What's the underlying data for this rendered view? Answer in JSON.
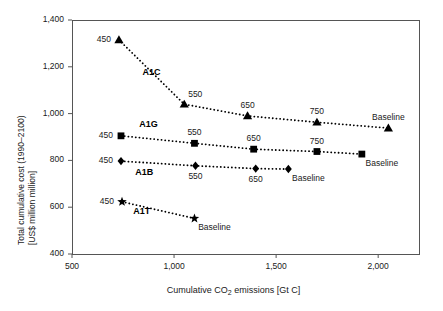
{
  "chart_data": {
    "type": "scatter",
    "title": "",
    "xlabel": "Cumulative CO2 emissions [Gt C]",
    "xlabel_parts": {
      "pre": "Cumulative CO",
      "sub": "2",
      "post": " emissions [Gt C]"
    },
    "ylabel_line1": "Total cumulative cost (1990–2100)",
    "ylabel_line2": "[US$ million million]",
    "xlim": [
      500,
      2200
    ],
    "ylim": [
      400,
      1400
    ],
    "xticks": [
      500,
      1000,
      1500,
      2000
    ],
    "xticklabels": [
      "500",
      "1,000",
      "1,500",
      "2,000"
    ],
    "yticks": [
      400,
      600,
      800,
      1000,
      1200,
      1400
    ],
    "yticklabels": [
      "400",
      "600",
      "800",
      "1,000",
      "1,200",
      "1,400"
    ],
    "grid": false,
    "legend": "none",
    "line_style": "dotted",
    "color": "#000000",
    "series": [
      {
        "name": "A1C",
        "marker": "triangle",
        "label_x": 845,
        "label_y": 1175,
        "points": [
          {
            "label": "450",
            "x": 730,
            "y": 1315,
            "label_pos": "left"
          },
          {
            "label": "550",
            "x": 1050,
            "y": 1040,
            "label_pos": "above-right"
          },
          {
            "label": "650",
            "x": 1360,
            "y": 990,
            "label_pos": "above"
          },
          {
            "label": "750",
            "x": 1700,
            "y": 963,
            "label_pos": "above"
          },
          {
            "label": "Baseline",
            "x": 2050,
            "y": 938,
            "label_pos": "above"
          }
        ]
      },
      {
        "name": "A1G",
        "marker": "square",
        "label_x": 830,
        "label_y": 950,
        "points": [
          {
            "label": "450",
            "x": 740,
            "y": 905,
            "label_pos": "left"
          },
          {
            "label": "550",
            "x": 1100,
            "y": 873,
            "label_pos": "above"
          },
          {
            "label": "650",
            "x": 1390,
            "y": 848,
            "label_pos": "above"
          },
          {
            "label": "750",
            "x": 1700,
            "y": 838,
            "label_pos": "above"
          },
          {
            "label": "Baseline",
            "x": 1920,
            "y": 827,
            "label_pos": "below-right"
          }
        ]
      },
      {
        "name": "A1B",
        "marker": "diamond",
        "label_x": 810,
        "label_y": 745,
        "points": [
          {
            "label": "450",
            "x": 740,
            "y": 797,
            "label_pos": "left"
          },
          {
            "label": "550",
            "x": 1105,
            "y": 777,
            "label_pos": "below"
          },
          {
            "label": "650",
            "x": 1400,
            "y": 765,
            "label_pos": "below"
          },
          {
            "label": "Baseline",
            "x": 1560,
            "y": 763,
            "label_pos": "below-right"
          }
        ]
      },
      {
        "name": "A1T",
        "marker": "star",
        "label_x": 800,
        "label_y": 578,
        "points": [
          {
            "label": "450",
            "x": 745,
            "y": 623,
            "label_pos": "left"
          },
          {
            "label": "Baseline",
            "x": 1100,
            "y": 552,
            "label_pos": "below-right"
          }
        ]
      }
    ]
  }
}
